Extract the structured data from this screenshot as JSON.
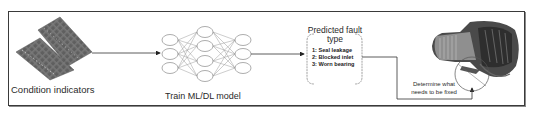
{
  "diagram": {
    "type": "ml-fault-diagnosis-pipeline",
    "stages": [
      {
        "id": "condition-indicators",
        "label": "Condition indicators",
        "icon": "data-grid-icon"
      },
      {
        "id": "train-model",
        "label": "Train ML/DL model",
        "icon": "neural-network-icon",
        "network": {
          "layers": [
            3,
            4,
            3
          ]
        }
      },
      {
        "id": "predicted-fault",
        "title_line1": "Predicted fault",
        "title_line2": "type",
        "faults": [
          "1: Seal leakage",
          "2: Blocked inlet",
          "3: Worn bearing"
        ]
      },
      {
        "id": "engine",
        "label": "Determine what needs to be fixed",
        "label_line1": "Determine what",
        "label_line2": "needs to be fixed",
        "icon": "jet-engine-icon"
      }
    ],
    "colors": {
      "border": "#3a3a3a",
      "grid_tile": "#6b6b6b",
      "node_stroke": "#8a8a8a",
      "arrow": "#333333"
    }
  }
}
